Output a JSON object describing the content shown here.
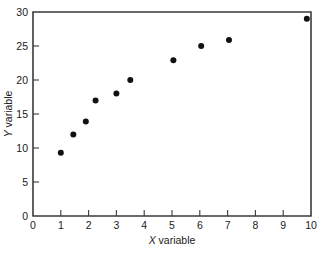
{
  "chart_data": {
    "type": "scatter",
    "title": "",
    "xlabel": "X variable",
    "ylabel": "Y variable",
    "xlim": [
      0,
      10
    ],
    "ylim": [
      0,
      30
    ],
    "grid": false,
    "legend": false,
    "x_ticks": [
      "0",
      "1",
      "2",
      "3",
      "4",
      "5",
      "6",
      "7",
      "8",
      "9",
      "10"
    ],
    "x_tick_values": [
      0,
      1,
      2,
      3,
      4,
      5,
      6,
      7,
      8,
      9,
      10
    ],
    "y_ticks": [
      "0",
      "5",
      "10",
      "15",
      "20",
      "25",
      "30"
    ],
    "y_tick_values": [
      0,
      5,
      10,
      15,
      20,
      25,
      30
    ],
    "marker": "filled-circle",
    "marker_color": "#111111",
    "marker_size": 3,
    "x": [
      1.0,
      1.45,
      1.9,
      2.25,
      3.0,
      3.5,
      5.05,
      6.05,
      7.05,
      9.85
    ],
    "y": [
      9.3,
      12.0,
      13.9,
      17.0,
      18.0,
      20.0,
      22.9,
      25.0,
      25.9,
      29.0
    ],
    "points": [
      {
        "x": 1.0,
        "y": 9.3
      },
      {
        "x": 1.45,
        "y": 12.0
      },
      {
        "x": 1.9,
        "y": 13.9
      },
      {
        "x": 2.25,
        "y": 17.0
      },
      {
        "x": 3.0,
        "y": 18.0
      },
      {
        "x": 3.5,
        "y": 20.0
      },
      {
        "x": 5.05,
        "y": 22.9
      },
      {
        "x": 6.05,
        "y": 25.0
      },
      {
        "x": 7.05,
        "y": 25.9
      },
      {
        "x": 9.85,
        "y": 29.0
      }
    ]
  },
  "figure": {
    "background_color": "#ffffff",
    "axis_color": "#3b3b3b",
    "text_color": "#1a1a1a"
  }
}
